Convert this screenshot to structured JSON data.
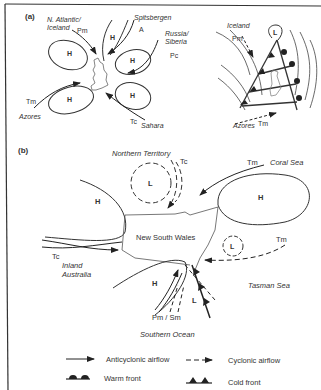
{
  "panel_a": {
    "label": "(a)",
    "left": {
      "sources": [
        {
          "place": "N. Atlantic/\nIceland",
          "place1": "N. Atlantic/",
          "place2": "Iceland",
          "mass": "Pm"
        },
        {
          "place": "Spitsbergen",
          "mass": "A"
        },
        {
          "place1": "Russia/",
          "place2": "Siberia",
          "mass": "Pc"
        },
        {
          "place": "Azores",
          "mass": "Tm"
        },
        {
          "place": "Sahara",
          "mass": "Tc"
        }
      ],
      "high_label": "H"
    },
    "right": {
      "low_label": "L",
      "north_place": "Iceland",
      "north_mass": "Pm",
      "south_place": "Azores",
      "south_mass": "Tm"
    }
  },
  "panel_b": {
    "label": "(b)",
    "regions": {
      "northern_territory": "Northern Territory",
      "coral_sea": "Coral Sea",
      "new_south_wales": "New South Wales",
      "inland_australia_1": "Inland",
      "inland_australia_2": "Australia",
      "tasman_sea": "Tasman Sea",
      "southern_ocean": "Southern Ocean"
    },
    "masses": {
      "nt_tc": "Tc",
      "coral_tm": "Tm",
      "inland_tc": "Tc",
      "tasman_tm": "Tm",
      "southern": "Pm / Sm"
    },
    "high_label": "H",
    "low_label": "L"
  },
  "legend": {
    "anticyclonic": "Anticyclonic airflow",
    "cyclonic": "Cyclonic airflow",
    "warm_front": "Warm front",
    "cold_front": "Cold front"
  }
}
